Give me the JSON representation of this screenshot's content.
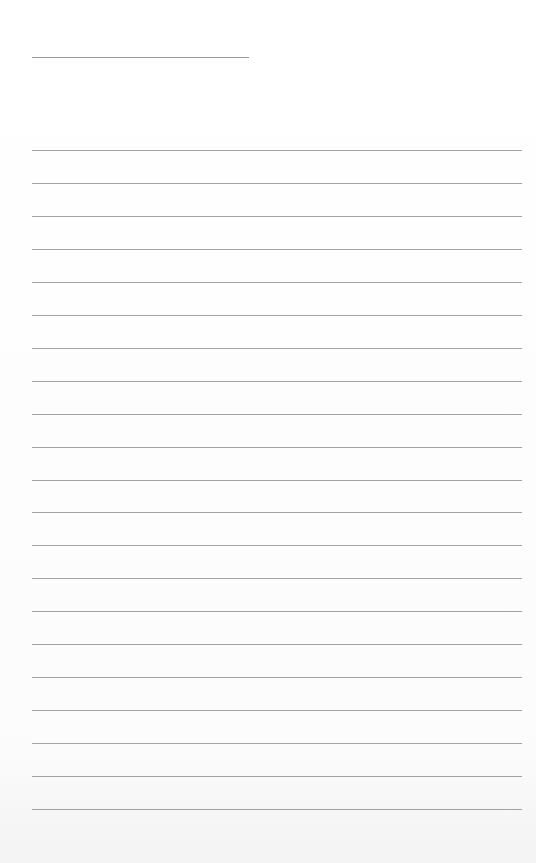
{
  "page": {
    "type": "blank-lined-paper",
    "title_line": {
      "x": 32,
      "y": 57,
      "width": 217
    },
    "rules": {
      "count": 21,
      "first_y": 150,
      "spacing": 32.95,
      "x": 32,
      "width": 490
    },
    "colors": {
      "background": "#ffffff",
      "rule": "#a3a3a3",
      "title_line": "#9a9a9a"
    }
  }
}
